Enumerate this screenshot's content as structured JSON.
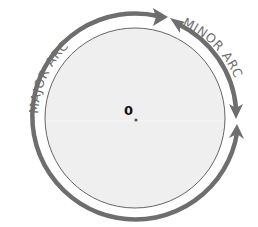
{
  "diagram": {
    "type": "circle-arcs",
    "center_label": "0",
    "labels": {
      "major_arc": "MAJOR ARC",
      "minor_arc": "MINOR ARC"
    },
    "colors": {
      "circle_fill": "#efefef",
      "circle_stroke": "#555555",
      "arc_stroke": "#6e6e6e",
      "text": "#6e6e6e",
      "center_text": "#111111"
    }
  }
}
